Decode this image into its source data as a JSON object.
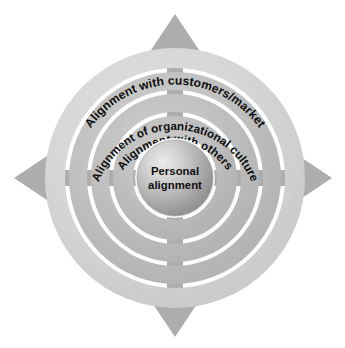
{
  "diagram": {
    "type": "concentric-rings",
    "center": {
      "cx": 175,
      "cy": 178
    },
    "core": {
      "label_line1": "Personal",
      "label_line2": "alignment",
      "radius": 38,
      "fill_light": "#e9e9e9",
      "fill_mid": "#b6b6b6",
      "fill_dark": "#8f8f8f",
      "stroke": "#f7f7f7"
    },
    "rings": [
      {
        "id": "ring-inner",
        "label": "Alignment with others",
        "outer_radius": 62,
        "inner_radius": 42,
        "color": "#c2c2c2"
      },
      {
        "id": "ring-middle",
        "label": "Alignment of organizational culture",
        "outer_radius": 84,
        "inner_radius": 66,
        "color": "#c2c2c2"
      },
      {
        "id": "ring-outer",
        "label": "Alignment with customers/market",
        "outer_radius": 106,
        "inner_radius": 88,
        "color": "#c2c2c2"
      },
      {
        "id": "ring-outermost",
        "label": "",
        "outer_radius": 130,
        "inner_radius": 110,
        "color": "#d7d7d7"
      }
    ],
    "arrows": [
      {
        "id": "arrow-up",
        "direction": "up",
        "color": "#adadad",
        "tip": {
          "x": 175,
          "y": 14
        }
      },
      {
        "id": "arrow-down",
        "direction": "down",
        "color": "#adadad",
        "tip": {
          "x": 175,
          "y": 337
        }
      },
      {
        "id": "arrow-left",
        "direction": "left",
        "color": "#adadad",
        "tip": {
          "x": 14,
          "y": 178
        }
      },
      {
        "id": "arrow-right",
        "direction": "right",
        "color": "#adadad",
        "tip": {
          "x": 332,
          "y": 178
        }
      }
    ],
    "colors": {
      "background": "#ffffff",
      "ring_gray": "#c2c2c2",
      "ring_outer_gray": "#d7d7d7",
      "arrow_gray": "#adadad",
      "gap_white": "#ffffff",
      "text_black": "#0d0d0d"
    }
  }
}
